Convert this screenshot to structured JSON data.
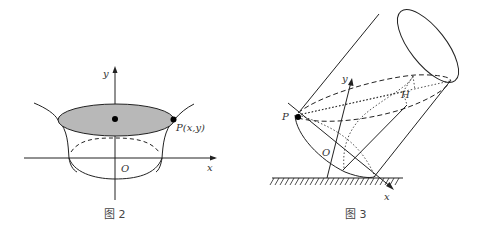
{
  "figure2": {
    "caption": "图 2",
    "labels": {
      "y_axis": "y",
      "x_axis": "x",
      "origin": "O",
      "point": "P(x,y)"
    },
    "fill_color": "#b5b5b5"
  },
  "figure3": {
    "caption": "图 3",
    "labels": {
      "y_axis": "y",
      "x_axis": "x",
      "origin": "O",
      "point": "P",
      "center": "H"
    }
  }
}
